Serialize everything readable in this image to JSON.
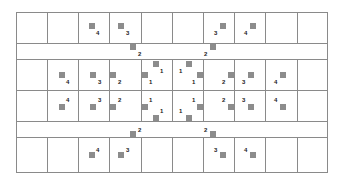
{
  "diagram": {
    "title": "",
    "grid": {
      "left": 16,
      "top": 12,
      "right": 328,
      "bottom": 173,
      "columns_x": [
        16,
        47,
        78,
        109,
        141,
        172,
        203,
        234,
        265,
        297,
        328
      ],
      "rows_y": [
        12,
        43,
        59,
        90,
        121,
        137,
        173
      ],
      "band_rows": [
        1,
        4
      ],
      "line_color": "#8a8a8a"
    },
    "marker_color": "#8c8c8c",
    "markers": [
      {
        "x": 89,
        "y": 23,
        "label": "4",
        "lx": 96,
        "ly": 30
      },
      {
        "x": 118,
        "y": 23,
        "label": "3",
        "lx": 126,
        "ly": 30
      },
      {
        "x": 130,
        "y": 44,
        "label": "2",
        "lx": 138,
        "ly": 51
      },
      {
        "x": 220,
        "y": 23,
        "label": "3",
        "lx": 214,
        "ly": 30
      },
      {
        "x": 250,
        "y": 23,
        "label": "4",
        "lx": 244,
        "ly": 30
      },
      {
        "x": 210,
        "y": 44,
        "label": "2",
        "lx": 204,
        "ly": 51
      },
      {
        "x": 59,
        "y": 72,
        "label": "4",
        "lx": 66,
        "ly": 79
      },
      {
        "x": 90,
        "y": 72,
        "label": "3",
        "lx": 98,
        "ly": 79
      },
      {
        "x": 110,
        "y": 72,
        "label": "2",
        "lx": 118,
        "ly": 79
      },
      {
        "x": 142,
        "y": 72,
        "label": "1",
        "lx": 149,
        "ly": 79
      },
      {
        "x": 153,
        "y": 61,
        "label": "1",
        "lx": 160,
        "ly": 68
      },
      {
        "x": 186,
        "y": 61,
        "label": "1",
        "lx": 179,
        "ly": 68
      },
      {
        "x": 197,
        "y": 72,
        "label": "1",
        "lx": 192,
        "ly": 79
      },
      {
        "x": 228,
        "y": 72,
        "label": "2",
        "lx": 222,
        "ly": 79
      },
      {
        "x": 248,
        "y": 72,
        "label": "3",
        "lx": 242,
        "ly": 79
      },
      {
        "x": 280,
        "y": 72,
        "label": "4",
        "lx": 274,
        "ly": 79
      },
      {
        "x": 59,
        "y": 104,
        "label": "4",
        "lx": 66,
        "ly": 97
      },
      {
        "x": 90,
        "y": 104,
        "label": "3",
        "lx": 98,
        "ly": 97
      },
      {
        "x": 110,
        "y": 104,
        "label": "2",
        "lx": 118,
        "ly": 97
      },
      {
        "x": 142,
        "y": 104,
        "label": "1",
        "lx": 149,
        "ly": 97
      },
      {
        "x": 153,
        "y": 115,
        "label": "1",
        "lx": 160,
        "ly": 108
      },
      {
        "x": 186,
        "y": 115,
        "label": "1",
        "lx": 179,
        "ly": 108
      },
      {
        "x": 197,
        "y": 104,
        "label": "1",
        "lx": 192,
        "ly": 97
      },
      {
        "x": 228,
        "y": 104,
        "label": "2",
        "lx": 222,
        "ly": 97
      },
      {
        "x": 248,
        "y": 104,
        "label": "3",
        "lx": 242,
        "ly": 97
      },
      {
        "x": 280,
        "y": 104,
        "label": "4",
        "lx": 274,
        "ly": 97
      },
      {
        "x": 130,
        "y": 131,
        "label": "2",
        "lx": 138,
        "ly": 127
      },
      {
        "x": 210,
        "y": 131,
        "label": "2",
        "lx": 204,
        "ly": 127
      },
      {
        "x": 89,
        "y": 152,
        "label": "4",
        "lx": 96,
        "ly": 147
      },
      {
        "x": 118,
        "y": 152,
        "label": "3",
        "lx": 126,
        "ly": 147
      },
      {
        "x": 220,
        "y": 152,
        "label": "3",
        "lx": 214,
        "ly": 147
      },
      {
        "x": 250,
        "y": 152,
        "label": "4",
        "lx": 244,
        "ly": 147
      }
    ]
  }
}
